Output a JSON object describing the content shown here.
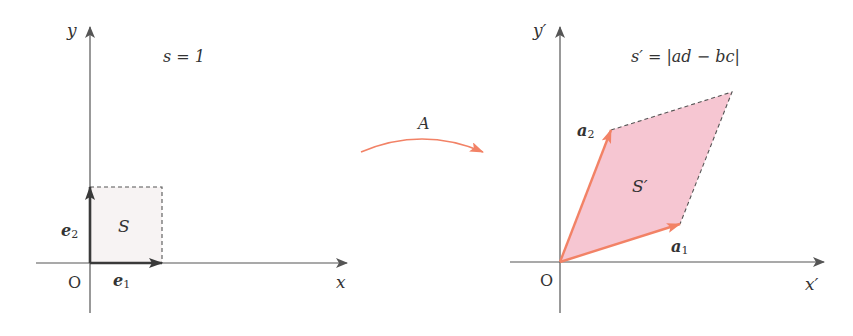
{
  "colors": {
    "axis": "#555555",
    "text": "#333333",
    "basis_vector": "#3a3a3a",
    "transformed_vector": "#f28266",
    "square_fill": "#f7f3f3",
    "parallelogram_fill": "#f6c6d2",
    "dashed_edge": "#555555",
    "map_arrow": "#f28266"
  },
  "left_panel": {
    "y_axis_label": "y",
    "x_axis_label": "x",
    "origin_label": "O",
    "area_formula": "s = 1",
    "region_label": "S",
    "vector_e1_label": "e",
    "vector_e1_sub": "1",
    "vector_e2_label": "e",
    "vector_e2_sub": "2"
  },
  "transform": {
    "label": "A"
  },
  "right_panel": {
    "y_axis_label": "y′",
    "x_axis_label": "x′",
    "origin_label": "O",
    "area_formula": "s′ = |ad − bc|",
    "region_label": "S′",
    "vector_a1_label": "a",
    "vector_a1_sub": "1",
    "vector_a2_label": "a",
    "vector_a2_sub": "2"
  }
}
